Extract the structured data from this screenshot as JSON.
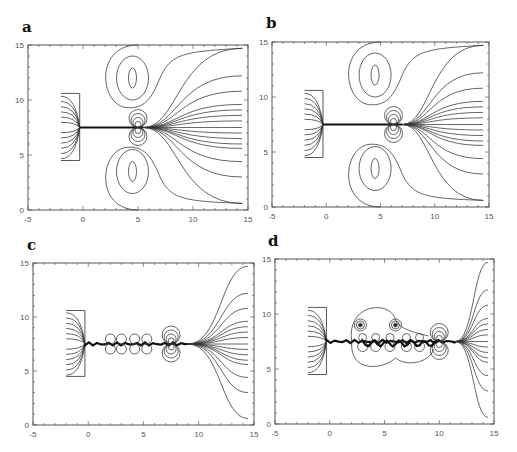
{
  "figure": {
    "panels": [
      {
        "id": "a",
        "label": "a"
      },
      {
        "id": "b",
        "label": "b"
      },
      {
        "id": "c",
        "label": "c"
      },
      {
        "id": "d",
        "label": "d"
      }
    ],
    "x_ticks": [
      "-5",
      "0",
      "5",
      "10",
      "15"
    ],
    "y_ticks": [
      "0",
      "5",
      "10",
      "15"
    ]
  },
  "chart_data": [
    {
      "type": "contour",
      "panel": "a",
      "xlim": [
        -5,
        15
      ],
      "ylim": [
        0,
        15
      ],
      "x_ticks": [
        -5,
        0,
        5,
        10,
        15
      ],
      "y_ticks": [
        0,
        5,
        10,
        15
      ],
      "electrode_box": {
        "x": [
          -2,
          -0.3
        ],
        "y": [
          4.5,
          10.6
        ]
      },
      "channel_y": 7.5,
      "channel_tip_x": 5.5,
      "dipole_x": 5,
      "vortex_centers": [
        [
          4.5,
          12
        ],
        [
          4.5,
          3.5
        ]
      ]
    },
    {
      "type": "contour",
      "panel": "b",
      "xlim": [
        -5,
        15
      ],
      "ylim": [
        0,
        15
      ],
      "x_ticks": [
        -5,
        0,
        5,
        10,
        15
      ],
      "y_ticks": [
        0,
        5,
        10,
        15
      ],
      "electrode_box": {
        "x": [
          -2,
          -0.3
        ],
        "y": [
          4.5,
          10.6
        ]
      },
      "channel_y": 7.5,
      "channel_tip_x": 7,
      "dipole_x": 6.2,
      "vortex_centers": [
        [
          4.5,
          12
        ],
        [
          4.5,
          3.5
        ]
      ]
    },
    {
      "type": "contour",
      "panel": "c",
      "xlim": [
        -5,
        15
      ],
      "ylim": [
        0,
        15
      ],
      "x_ticks": [
        -5,
        0,
        5,
        10,
        15
      ],
      "y_ticks": [
        0,
        5,
        10,
        15
      ],
      "electrode_box": {
        "x": [
          -2,
          -0.3
        ],
        "y": [
          4.5,
          10.6
        ]
      },
      "channel_y": 7.5,
      "channel_tip_x": 9,
      "dipole_x": 7.5
    },
    {
      "type": "contour",
      "panel": "d",
      "xlim": [
        -5,
        15
      ],
      "ylim": [
        0,
        15
      ],
      "x_ticks": [
        -5,
        0,
        5,
        10,
        15
      ],
      "y_ticks": [
        0,
        5,
        10,
        15
      ],
      "electrode_box": {
        "x": [
          -2,
          -0.3
        ],
        "y": [
          4.5,
          10.6
        ]
      },
      "channel_y": 7.5,
      "channel_tip_x": 11.5,
      "dipole_x": 10
    }
  ]
}
